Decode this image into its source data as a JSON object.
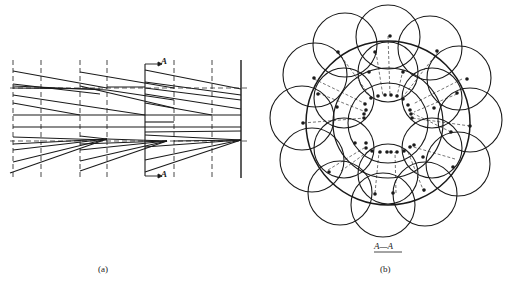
{
  "figure_a": {
    "caption": "(a)",
    "section_marker_top": "A",
    "section_marker_bottom": "A"
  },
  "figure_b": {
    "caption": "(b)",
    "section_label": "A—A"
  },
  "colors": {
    "line": "#1a1a1a",
    "background": "#ffffff"
  }
}
